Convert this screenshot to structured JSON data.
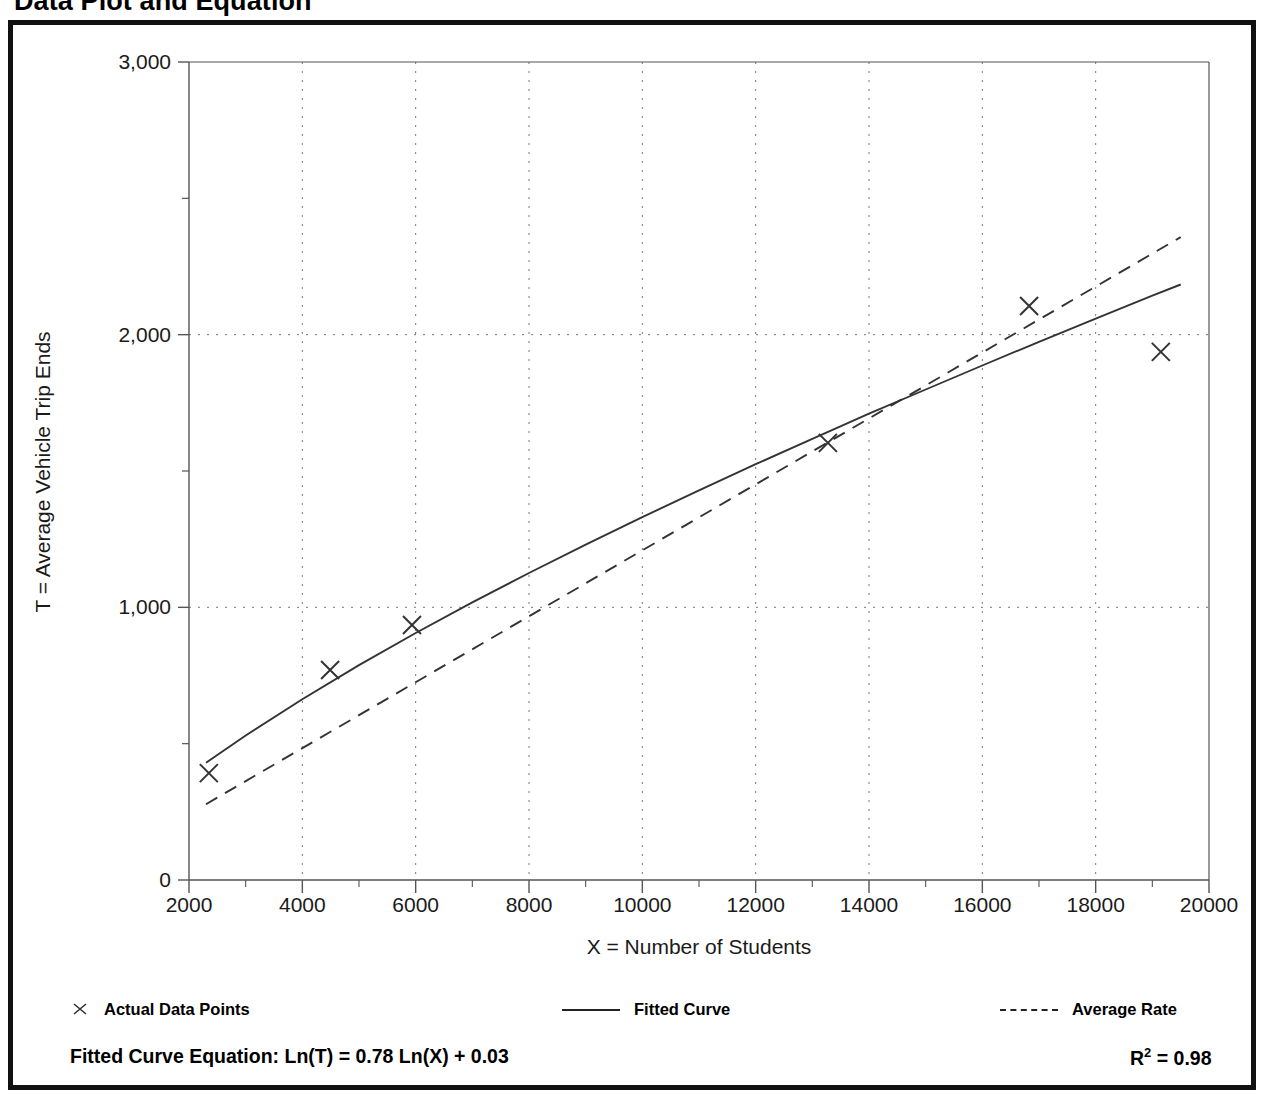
{
  "title": "Data Plot and Equation",
  "chart_data": {
    "type": "scatter",
    "title": "Data Plot and Equation",
    "xlabel": "X = Number of Students",
    "ylabel": "T = Average Vehicle Trip Ends",
    "xlim": [
      2000,
      20000
    ],
    "ylim": [
      0,
      3000
    ],
    "grid": true,
    "x_ticks": [
      2000,
      4000,
      6000,
      8000,
      10000,
      12000,
      14000,
      16000,
      18000,
      20000
    ],
    "x_tick_labels": [
      "2000",
      "4000",
      "6000",
      "8000",
      "10000",
      "12000",
      "14000",
      "16000",
      "18000",
      "20000"
    ],
    "x_minor_tick_step": 1000,
    "y_ticks": [
      0,
      1000,
      2000,
      3000
    ],
    "y_tick_labels": [
      "0",
      "1,000",
      "2,000",
      "3,000"
    ],
    "y_minor_tick_step": 500,
    "legend_position": "below-axes",
    "series": [
      {
        "name": "Actual Data Points",
        "type": "scatter",
        "marker": "x",
        "color": "#333333",
        "points": [
          {
            "x": 2350,
            "y": 392
          },
          {
            "x": 4490,
            "y": 770
          },
          {
            "x": 5935,
            "y": 935
          },
          {
            "x": 13275,
            "y": 1603
          },
          {
            "x": 16825,
            "y": 2105
          },
          {
            "x": 19150,
            "y": 1937
          }
        ]
      },
      {
        "name": "Fitted Curve",
        "type": "line",
        "style": "solid",
        "color": "#333333",
        "equation": "Ln(T) = 0.78 Ln(X) + 0.03",
        "points": [
          {
            "x": 2300,
            "y": 430
          },
          {
            "x": 3000,
            "y": 530
          },
          {
            "x": 4000,
            "y": 663
          },
          {
            "x": 5000,
            "y": 788
          },
          {
            "x": 6000,
            "y": 906
          },
          {
            "x": 7000,
            "y": 1018
          },
          {
            "x": 8000,
            "y": 1126
          },
          {
            "x": 9000,
            "y": 1230
          },
          {
            "x": 10000,
            "y": 1331
          },
          {
            "x": 11000,
            "y": 1429
          },
          {
            "x": 12000,
            "y": 1525
          },
          {
            "x": 13000,
            "y": 1618
          },
          {
            "x": 14000,
            "y": 1710
          },
          {
            "x": 15000,
            "y": 1799
          },
          {
            "x": 16000,
            "y": 1887
          },
          {
            "x": 17000,
            "y": 1974
          },
          {
            "x": 18000,
            "y": 2059
          },
          {
            "x": 19000,
            "y": 2143
          },
          {
            "x": 19500,
            "y": 2184
          }
        ]
      },
      {
        "name": "Average Rate",
        "type": "line",
        "style": "dashed",
        "color": "#333333",
        "points": [
          {
            "x": 2300,
            "y": 278
          },
          {
            "x": 19500,
            "y": 2358
          }
        ]
      }
    ]
  },
  "legend": {
    "items": [
      {
        "label": "Actual Data Points",
        "marker": "x-marker"
      },
      {
        "label": "Fitted Curve",
        "marker": "solid-line"
      },
      {
        "label": "Average Rate",
        "marker": "dashed-line"
      }
    ]
  },
  "equation": {
    "text": "Fitted Curve Equation:  Ln(T) = 0.78 Ln(X) + 0.03",
    "r_squared_prefix": "R",
    "r_squared_exponent": "2",
    "r_squared_value": " = 0.98"
  },
  "colors": {
    "frame": "#111111",
    "axis": "#555555",
    "grid": "#777777",
    "data": "#333333"
  }
}
